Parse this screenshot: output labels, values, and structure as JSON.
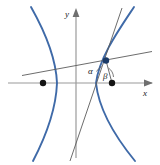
{
  "figure": {
    "background_color": "#ffffff",
    "width": 160,
    "height": 165
  },
  "axes": {
    "x_label": "x",
    "y_label": "y",
    "axis_color": "#9a9a9a",
    "origin": {
      "x": 76,
      "y": 83
    },
    "x_axis": {
      "x1": 8,
      "y1": 83,
      "x2": 152,
      "y2": 83
    },
    "y_axis": {
      "x1": 76,
      "y1": 158,
      "x2": 76,
      "y2": 9
    },
    "x_label_pos": {
      "x": 143,
      "y": 95
    },
    "y_label_pos": {
      "x": 66,
      "y": 16
    }
  },
  "curve": {
    "name": "hyperbola",
    "color": "#3f6aa8",
    "stroke_width": 1.9,
    "left_branch_vertex": {
      "x": 57,
      "y": 83
    },
    "right_branch_vertex": {
      "x": 96,
      "y": 83
    },
    "left_branch_path": "M 31,8 C 44,30 56,58 57,83 C 56,110 45,138 33,160",
    "right_branch_path": "M 133,8 C 118,32 99,58 96,83 C 99,112 117,138 134,160"
  },
  "foci": [
    {
      "name": "left-focus",
      "x": 43,
      "y": 83,
      "radius": 3.1,
      "color": "#141414"
    },
    {
      "name": "right-focus",
      "x": 112,
      "y": 83,
      "radius": 3.1,
      "color": "#141414"
    }
  ],
  "point_p": {
    "name": "tangency-point",
    "x": 106,
    "y": 61,
    "radius": 3.1,
    "color": "#1b3a66"
  },
  "lines": {
    "color": "#5b5b5b",
    "stroke_width": 0.9,
    "focal_radius_left": {
      "x1": 24,
      "y1": 75,
      "x2": 151,
      "y2": 52
    },
    "focal_radius_right": {
      "x1": 112,
      "y1": 83,
      "x2": 106,
      "y2": 61
    },
    "tangent": {
      "x1": 70,
      "y1": 160,
      "x2": 122,
      "y2": 9
    }
  },
  "angles": [
    {
      "name": "alpha",
      "label": "α",
      "label_x": 90,
      "label_y": 73,
      "arc_path": "M 95,70 A 13,13 0 0 1 100,66"
    },
    {
      "name": "beta",
      "label": "β",
      "label_x": 105,
      "label_y": 77,
      "arc_path": "M 109,69 A 11,11 0 0 1 114,76"
    }
  ],
  "arrowheads": {
    "x_arrow_points": "152,83 144,80 144,86",
    "y_arrow_points": "76,9 73,17 79,17",
    "color": "#6f6f6f"
  }
}
